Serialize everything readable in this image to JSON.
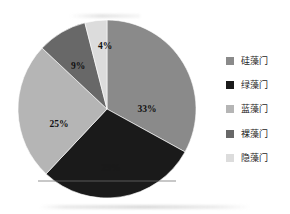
{
  "chart_data": {
    "type": "pie",
    "title": "",
    "subtitle": "",
    "xlabel": "",
    "ylabel": "",
    "grid": false,
    "legend_position": "right",
    "start_angle_deg": 0,
    "direction": "clockwise",
    "categories": [
      "硅藻门",
      "绿藻门",
      "蓝藻门",
      "裸藻门",
      "隐藻门"
    ],
    "values": [
      33,
      29,
      25,
      9,
      4
    ],
    "value_unit": "%",
    "slices": [
      {
        "label": "硅藻门",
        "value": 33,
        "data_label": "33%",
        "color": "#8a8a8a",
        "start_deg": 0,
        "end_deg": 118.8
      },
      {
        "label": "绿藻门",
        "value": 29,
        "data_label": "29%",
        "color": "#1a1a1a",
        "start_deg": 118.8,
        "end_deg": 223.2
      },
      {
        "label": "蓝藻门",
        "value": 25,
        "data_label": "25%",
        "color": "#b5b5b5",
        "start_deg": 223.2,
        "end_deg": 313.2
      },
      {
        "label": "裸藻门",
        "value": 9,
        "data_label": "9%",
        "color": "#686868",
        "start_deg": 313.2,
        "end_deg": 345.6
      },
      {
        "label": "隐藻门",
        "value": 4,
        "data_label": "4%",
        "color": "#dcdcdc",
        "start_deg": 345.6,
        "end_deg": 360
      }
    ],
    "legend": [
      {
        "label": "硅藻门",
        "color": "#8a8a8a"
      },
      {
        "label": "绿藻门",
        "color": "#1a1a1a"
      },
      {
        "label": "蓝藻门",
        "color": "#b5b5b5"
      },
      {
        "label": "裸藻门",
        "color": "#686868"
      },
      {
        "label": "隐藻门",
        "color": "#dcdcdc"
      }
    ]
  }
}
